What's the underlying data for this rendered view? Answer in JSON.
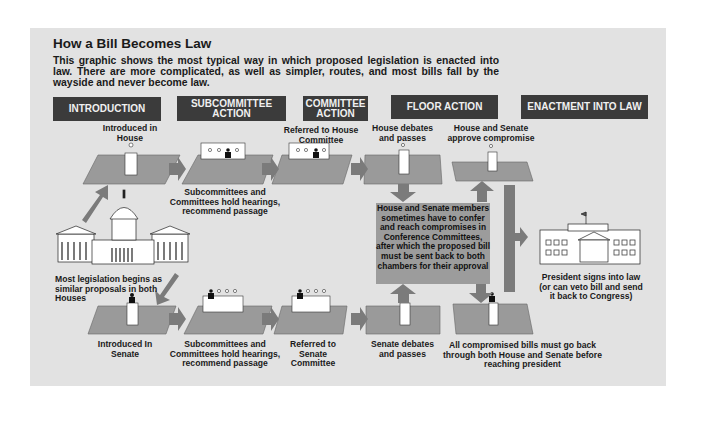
{
  "title": "How a Bill Becomes Law",
  "intro_text": "This graphic shows the most typical way in which proposed legislation is enacted into law. There are more complicated, as well as simpler, routes, and most bills fall by the wayside and never become law.",
  "stages": [
    {
      "label": "INTRODUCTION"
    },
    {
      "label": "SUBCOMMITTEE ACTION"
    },
    {
      "label": "COMMITTEE ACTION"
    },
    {
      "label": "FLOOR ACTION"
    },
    {
      "label": "ENACTMENT INTO LAW"
    }
  ],
  "house_track": {
    "introduced": "Introduced in House",
    "subcommittee": "Subcommittees and Committees hold hearings, recommend passage",
    "referred": "Referred to House Committee",
    "floor": "House debates and passes",
    "approve": "House and Senate approve compromise"
  },
  "senate_track": {
    "introduced": "Introduced In Senate",
    "subcommittee": "Subcommittees and Committees hold hearings, recommend passage",
    "referred": "Referred to Senate Committee",
    "floor": "Senate debates and passes",
    "approve": "All compromised bills must go back through both House and Senate before reaching president"
  },
  "origin_label": "Most legislation begins as similar proposals in both Houses",
  "conference_text": "House and Senate members sometimes have to confer and reach compromises in Conference Committees, after which the proposed bill must be sent back to both chambers for their approval",
  "president_label": "President signs into law (or can veto bill and send it back to Congress)",
  "colors": {
    "panel": "#e2e2e2",
    "header": "#3b3b3b",
    "platform": "#9a9a9a",
    "arrow": "#7b7b7b",
    "conference_box": "#9c9c9c"
  }
}
